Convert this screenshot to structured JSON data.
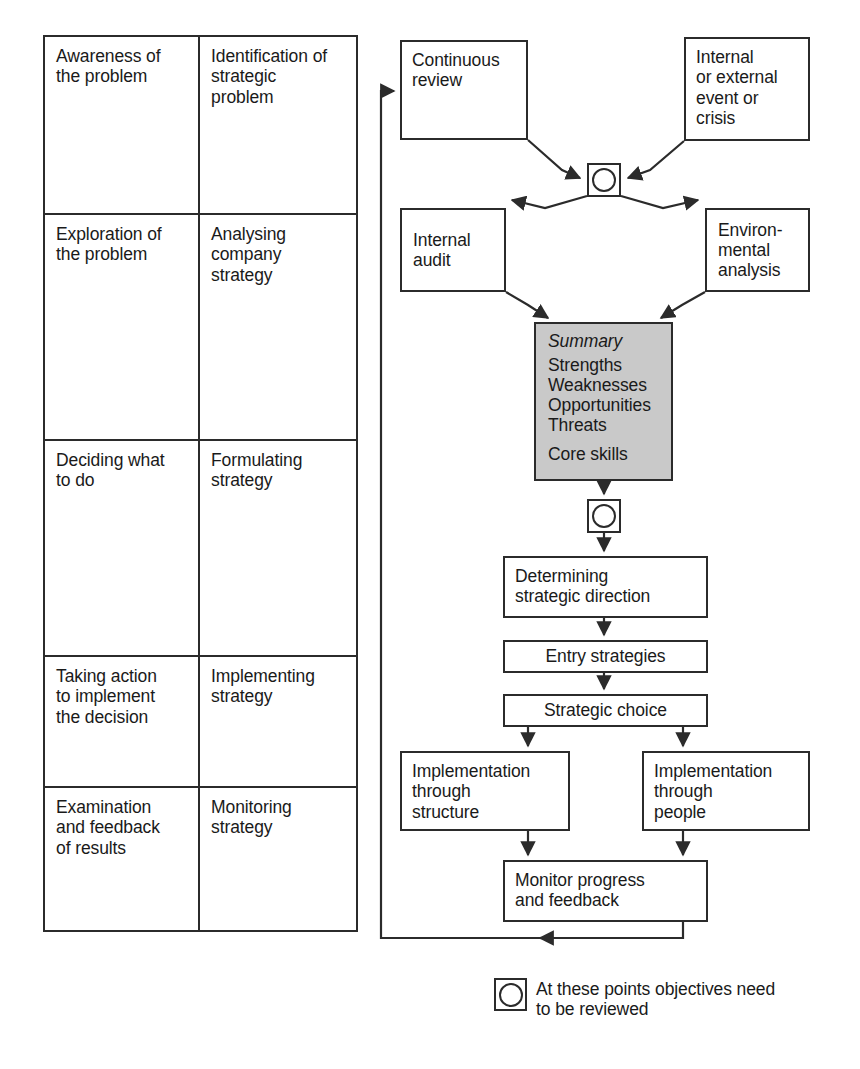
{
  "stage_table": {
    "col_headers_visible": false,
    "rows": [
      {
        "stage": "Awareness of\nthe problem",
        "activity": "Identification of\nstrategic\nproblem",
        "height": 178
      },
      {
        "stage": "Exploration of\nthe problem",
        "activity": "Analysing\ncompany\nstrategy",
        "height": 226
      },
      {
        "stage": "Deciding what\nto do",
        "activity": "Formulating\nstrategy",
        "height": 216
      },
      {
        "stage": "Taking action\nto implement\nthe decision",
        "activity": "Implementing\nstrategy",
        "height": 131
      },
      {
        "stage": "Examination\nand feedback\nof results",
        "activity": "Monitoring\nstrategy",
        "height": 142
      }
    ]
  },
  "flow": {
    "nodes": {
      "continuous_review": "Continuous\nreview",
      "event_or_crisis": "Internal\nor external\nevent or\ncrisis",
      "internal_audit": "Internal\naudit",
      "environmental_analysis": "Environ-\nmental\nanalysis",
      "determining_direction": "Determining\nstrategic direction",
      "entry_strategies": "Entry strategies",
      "strategic_choice": "Strategic choice",
      "implementation_structure": "Implementation\nthrough\nstructure",
      "implementation_people": "Implementation\nthrough\npeople",
      "monitor_progress": "Monitor progress\nand feedback"
    },
    "summary_box": {
      "title": "Summary",
      "items": [
        "Strengths",
        "Weaknesses",
        "Opportunities",
        "Threats"
      ],
      "extra_item": "Core skills",
      "fill_color": "#c9c9c9"
    },
    "review_markers": {
      "icon": "circle-in-square-icon",
      "count": 2
    }
  },
  "legend": {
    "icon": "circle-in-square-icon",
    "text": "At these points objectives need\nto be reviewed"
  },
  "colors": {
    "line": "#2b2b2b",
    "text": "#1a1a1a",
    "summary_fill": "#c9c9c9",
    "background": "#ffffff"
  }
}
